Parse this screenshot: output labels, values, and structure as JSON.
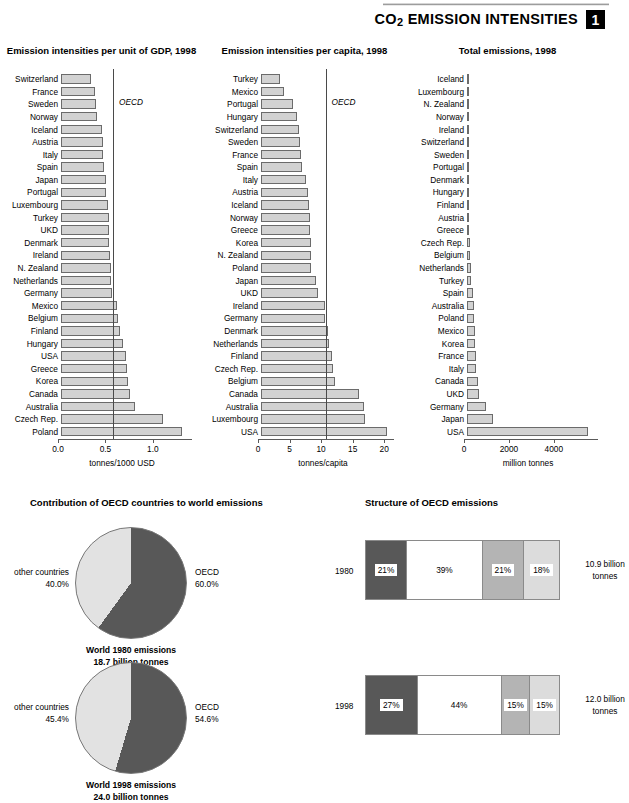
{
  "header": {
    "title_main": "CO",
    "title_sub": "2",
    "title_rest": " EMISSION INTENSITIES",
    "chapter": "1"
  },
  "chart_data": [
    {
      "id": "gdp",
      "type": "bar",
      "title": "Emission intensities per unit of GDP, 1998",
      "xlabel": "tonnes/1000 USD",
      "ylabel": "",
      "orientation": "horizontal",
      "xlim": [
        0,
        1.35
      ],
      "ticks": [
        0.0,
        0.5,
        1.0
      ],
      "tick_labels": [
        "0.0",
        "0.5",
        "1.0"
      ],
      "reference_line": {
        "label": "OECD",
        "value": 0.58
      },
      "categories": [
        "Switzerland",
        "France",
        "Sweden",
        "Norway",
        "Iceland",
        "Austria",
        "Italy",
        "Spain",
        "Japan",
        "Portugal",
        "Luxembourg",
        "Turkey",
        "UKD",
        "Denmark",
        "Ireland",
        "N. Zealand",
        "Netherlands",
        "Germany",
        "Mexico",
        "Belgium",
        "Finland",
        "Hungary",
        "USA",
        "Greece",
        "Korea",
        "Canada",
        "Australia",
        "Czech Rep.",
        "Poland"
      ],
      "values": [
        0.32,
        0.36,
        0.37,
        0.38,
        0.43,
        0.44,
        0.44,
        0.45,
        0.47,
        0.47,
        0.5,
        0.51,
        0.51,
        0.51,
        0.52,
        0.53,
        0.53,
        0.54,
        0.59,
        0.6,
        0.62,
        0.65,
        0.69,
        0.7,
        0.71,
        0.73,
        0.78,
        1.08,
        1.28
      ]
    },
    {
      "id": "capita",
      "type": "bar",
      "title": "Emission intensities per capita, 1998",
      "xlabel": "tonnes/capita",
      "ylabel": "",
      "orientation": "horizontal",
      "xlim": [
        0,
        20.6
      ],
      "ticks": [
        0,
        5,
        10,
        15,
        20
      ],
      "tick_labels": [
        "0",
        "5",
        "10",
        "15",
        "20"
      ],
      "reference_line": {
        "label": "OECD",
        "value": 10.7
      },
      "categories": [
        "Turkey",
        "Mexico",
        "Portugal",
        "Hungary",
        "Switzerland",
        "Sweden",
        "France",
        "Spain",
        "Italy",
        "Austria",
        "Iceland",
        "Norway",
        "Greece",
        "Korea",
        "N. Zealand",
        "Poland",
        "Japan",
        "UKD",
        "Ireland",
        "Germany",
        "Denmark",
        "Netherlands",
        "Finland",
        "Czech Rep.",
        "Belgium",
        "Canada",
        "Australia",
        "Luxembourg",
        "USA"
      ],
      "values": [
        3.0,
        3.7,
        5.1,
        5.7,
        6.0,
        6.2,
        6.4,
        6.5,
        7.2,
        7.5,
        7.6,
        7.7,
        7.8,
        7.9,
        8.0,
        8.0,
        8.7,
        9.1,
        10.2,
        10.2,
        10.6,
        10.7,
        11.3,
        11.4,
        11.8,
        15.5,
        16.4,
        16.5,
        20.0
      ]
    },
    {
      "id": "total",
      "type": "bar",
      "title": "Total emissions, 1998",
      "xlabel": "million tonnes",
      "ylabel": "",
      "orientation": "horizontal",
      "xlim": [
        0,
        5700
      ],
      "ticks": [
        0,
        2000,
        4000
      ],
      "tick_labels": [
        "0",
        "2000",
        "4000"
      ],
      "categories": [
        "Iceland",
        "Luxembourg",
        "N. Zealand",
        "Norway",
        "Ireland",
        "Switzerland",
        "Sweden",
        "Portugal",
        "Denmark",
        "Hungary",
        "Finland",
        "Austria",
        "Greece",
        "Czech Rep.",
        "Belgium",
        "Netherlands",
        "Turkey",
        "Spain",
        "Australia",
        "Poland",
        "Mexico",
        "Korea",
        "France",
        "Italy",
        "Canada",
        "UKD",
        "Germany",
        "Japan",
        "USA"
      ],
      "values": [
        2,
        7,
        30,
        34,
        38,
        43,
        55,
        53,
        58,
        58,
        58,
        60,
        82,
        118,
        120,
        170,
        190,
        260,
        310,
        310,
        360,
        370,
        380,
        420,
        470,
        540,
        860,
        1180,
        5400
      ]
    },
    {
      "id": "pie1980",
      "type": "pie",
      "title": "Contribution of OECD countries to world emissions",
      "labels": [
        "OECD",
        "other countries"
      ],
      "values": [
        60.0,
        40.0
      ],
      "value_labels": [
        "60.0%",
        "40.0%"
      ],
      "caption_line1": "World 1980 emissions",
      "caption_line2": "18.7 billion tonnes"
    },
    {
      "id": "pie1998",
      "type": "pie",
      "title": "",
      "labels": [
        "OECD",
        "other countries"
      ],
      "values": [
        54.6,
        45.4
      ],
      "value_labels": [
        "54.6%",
        "45.4%"
      ],
      "caption_line1": "World 1998 emissions",
      "caption_line2": "24.0 billion tonnes"
    },
    {
      "id": "struct1980",
      "type": "bar",
      "subtype": "stacked",
      "title": "Structure of OECD emissions",
      "year": "1980",
      "categories": [
        "segment-1",
        "segment-2",
        "segment-3",
        "segment-4"
      ],
      "values": [
        21,
        39,
        21,
        18
      ],
      "value_labels": [
        "21%",
        "39%",
        "21%",
        "18%"
      ],
      "total_line1": "10.9 billion",
      "total_line2": "tonnes"
    },
    {
      "id": "struct1998",
      "type": "bar",
      "subtype": "stacked",
      "title": "",
      "year": "1998",
      "categories": [
        "segment-1",
        "segment-2",
        "segment-3",
        "segment-4"
      ],
      "values": [
        27,
        44,
        15,
        15
      ],
      "value_labels": [
        "27%",
        "44%",
        "15%",
        "15%"
      ],
      "total_line1": "12.0 billion",
      "total_line2": "tonnes"
    }
  ],
  "colors": {
    "bar_fill": "#d2d2d2",
    "bar_stroke": "#6b6b6b",
    "pie_oecd": "#585858",
    "pie_other": "#e2e2e2",
    "seg1": "#585858",
    "seg2": "#ffffff",
    "seg3": "#b4b4b4",
    "seg4": "#dcdcdc"
  }
}
